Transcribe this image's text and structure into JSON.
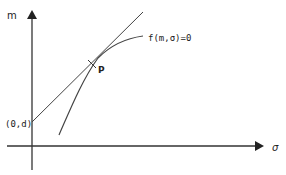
{
  "diagram": {
    "type": "tangent-line-to-curve",
    "axes": {
      "y_label": "m",
      "x_label": "σ"
    },
    "intercept_label": "(0,d)",
    "point_label": "P",
    "curve_label": "f(m,σ)=0",
    "colors": {
      "stroke": "#333333",
      "background": "#ffffff"
    }
  }
}
